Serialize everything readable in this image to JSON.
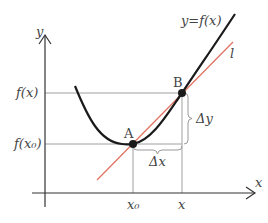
{
  "diagram": {
    "axes": {
      "x_label": "x",
      "y_label": "y"
    },
    "curve": {
      "label": "y=f(x)",
      "color": "#1a1a1a"
    },
    "tangent": {
      "label": "l",
      "color": "#e0705f"
    },
    "points": [
      {
        "name": "A",
        "label": "A"
      },
      {
        "name": "B",
        "label": "B"
      }
    ],
    "y_ticks": [
      {
        "label": "f(x)"
      },
      {
        "label": "f(x₀)"
      }
    ],
    "x_ticks": [
      {
        "label": "x₀"
      },
      {
        "label": "x"
      }
    ],
    "increments": {
      "dx": "Δx",
      "dy": "Δy"
    },
    "guide_color": "#9a9a9a"
  }
}
